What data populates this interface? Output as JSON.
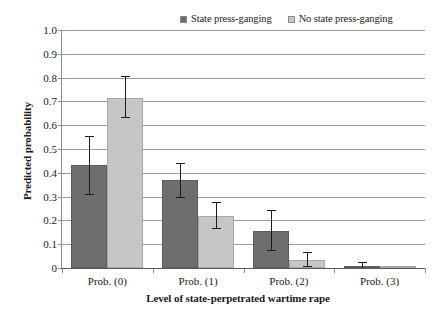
{
  "chart_data": {
    "type": "bar",
    "title": "",
    "xlabel": "Level of state-perpetrated wartime rape",
    "ylabel": "Predicted probability",
    "categories": [
      "Prob. (0)",
      "Prob. (1)",
      "Prob. (2)",
      "Prob. (3)"
    ],
    "ylim": [
      0,
      1.0
    ],
    "ytick_labels": [
      "1.0",
      "0.9",
      "0.8",
      "0.7",
      "0.6",
      "0.5",
      "0.4",
      "0.3",
      "0.2",
      "0.1",
      "0"
    ],
    "ytick_values": [
      1.0,
      0.9,
      0.8,
      0.7,
      0.6,
      0.5,
      0.4,
      0.3,
      0.2,
      0.1,
      0
    ],
    "grid": true,
    "legend_position": "top-right",
    "series": [
      {
        "name": "State press-ganging",
        "color": "#6e6e6e",
        "values": [
          0.432,
          0.369,
          0.154,
          0.007
        ],
        "error_low": [
          0.313,
          0.297,
          0.075,
          0.0
        ],
        "error_high": [
          0.555,
          0.441,
          0.242,
          0.026
        ]
      },
      {
        "name": "No state press-ganging",
        "color": "#c6c6c6",
        "values": [
          0.714,
          0.22,
          0.035,
          0.001
        ],
        "error_low": [
          0.634,
          0.167,
          0.009,
          0.0
        ],
        "error_high": [
          0.806,
          0.277,
          0.066,
          0.003
        ]
      }
    ]
  },
  "legend": {
    "entries": [
      {
        "label": "State press-ganging",
        "swatch_color": "#6e6e6e"
      },
      {
        "label": "No state press-ganging",
        "swatch_color": "#c6c6c6"
      }
    ]
  },
  "axes": {
    "y_title": "Predicted probability",
    "x_title": "Level of state-perpetrated wartime rape"
  }
}
